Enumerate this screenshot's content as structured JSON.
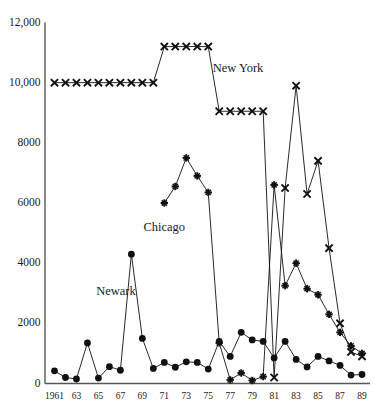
{
  "chart_data": {
    "type": "line",
    "title": "",
    "subtitle": "",
    "xlabel": "",
    "ylabel": "",
    "xlim": [
      1961,
      1989
    ],
    "ylim": [
      0,
      12000
    ],
    "grid": false,
    "legend_position": "inline-annotations",
    "y_ticks": [
      0,
      2000,
      4000,
      6000,
      8000,
      10000,
      12000
    ],
    "y_tick_labels": [
      "0",
      "2000",
      "4000",
      "6000",
      "8000",
      "10,000",
      "12,000"
    ],
    "x_ticks": [
      1961,
      1963,
      1965,
      1967,
      1969,
      1971,
      1973,
      1975,
      1977,
      1979,
      1981,
      1983,
      1985,
      1987,
      1989
    ],
    "x_tick_labels": [
      "1961",
      "63",
      "65",
      "67",
      "69",
      "71",
      "73",
      "75",
      "77",
      "79",
      "81",
      "83",
      "85",
      "87",
      "89"
    ],
    "x": [
      1961,
      1962,
      1963,
      1964,
      1965,
      1966,
      1967,
      1968,
      1969,
      1970,
      1971,
      1972,
      1973,
      1974,
      1975,
      1976,
      1977,
      1978,
      1979,
      1980,
      1981,
      1982,
      1983,
      1984,
      1985,
      1986,
      1987,
      1988,
      1989
    ],
    "series": [
      {
        "name": "New York",
        "marker": "x",
        "color": "#111111",
        "label_x": 1975.4,
        "label_y": 10450,
        "x": [
          1961,
          1962,
          1963,
          1964,
          1965,
          1966,
          1967,
          1968,
          1969,
          1970,
          1971,
          1972,
          1973,
          1974,
          1975,
          1976,
          1977,
          1978,
          1979,
          1980,
          1981,
          1982,
          1983,
          1984,
          1985,
          1986,
          1987,
          1988,
          1989
        ],
        "values": [
          10000,
          10000,
          10000,
          10000,
          10000,
          10000,
          10000,
          10000,
          10000,
          10000,
          11200,
          11200,
          11200,
          11200,
          11200,
          9050,
          9050,
          9050,
          9050,
          9050,
          200,
          6500,
          9900,
          6300,
          7400,
          4500,
          2000,
          1050,
          900
        ]
      },
      {
        "name": "Chicago",
        "marker": "plus",
        "color": "#111111",
        "label_x": 1969.1,
        "label_y": 5180,
        "x": [
          1971,
          1972,
          1973,
          1974,
          1975,
          1976,
          1977,
          1978,
          1979,
          1980,
          1981,
          1982,
          1983,
          1984,
          1985,
          1986,
          1987,
          1988,
          1989
        ],
        "values": [
          6000,
          6550,
          7500,
          6900,
          6350,
          1350,
          120,
          350,
          100,
          230,
          6600,
          3250,
          4000,
          3150,
          2950,
          2300,
          1700,
          1250,
          1000
        ]
      },
      {
        "name": "Newark",
        "marker": "dot",
        "color": "#111111",
        "label_x": 1964.8,
        "label_y": 3050,
        "x": [
          1961,
          1962,
          1963,
          1964,
          1965,
          1966,
          1967,
          1968,
          1969,
          1970,
          1971,
          1972,
          1973,
          1974,
          1975,
          1976,
          1977,
          1978,
          1979,
          1980,
          1981,
          1982,
          1983,
          1984,
          1985,
          1986,
          1987,
          1988,
          1989
        ],
        "values": [
          420,
          200,
          150,
          1350,
          180,
          560,
          440,
          4300,
          1500,
          500,
          700,
          540,
          720,
          700,
          480,
          1400,
          900,
          1700,
          1450,
          1400,
          850,
          1400,
          800,
          550,
          900,
          750,
          600,
          280,
          300
        ]
      }
    ],
    "annotations": [
      {
        "text": "New York",
        "x": 1975.4,
        "y": 10450
      },
      {
        "text": "Chicago",
        "x": 1969.1,
        "y": 5180
      },
      {
        "text": "Newark",
        "x": 1964.8,
        "y": 3050
      }
    ]
  }
}
